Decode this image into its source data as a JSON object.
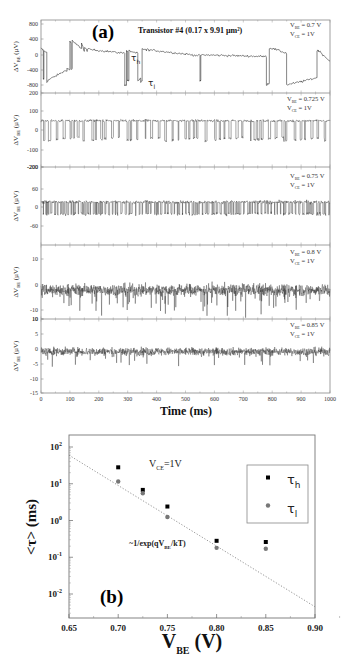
{
  "chart_data": [
    {
      "panel": "(a)",
      "type": "line",
      "title": "Transistor #4 (0.17 x 9.91 µm²)",
      "xlabel": "Time (ms)",
      "xlim": [
        0,
        1000
      ],
      "x_ticks": [
        "0",
        "100",
        "200",
        "300",
        "400",
        "500",
        "600",
        "700",
        "800",
        "900",
        "1000"
      ],
      "annotations": [
        "τh",
        "τl"
      ],
      "subplots": [
        {
          "ylabel": "ΔV_BE (µV)",
          "conditions": [
            "V_BE = 0.7 V",
            "V_CE = 1V"
          ],
          "y_ticks": [
            "800",
            "400",
            "0",
            "-400",
            "-800"
          ],
          "ylim": [
            -900,
            900
          ],
          "description": "Random telegraph signal, slow switching with drifting baseline between ~+300 and ~-600 µV",
          "levels": [
            {
              "state": "high",
              "approx_uV": 150
            },
            {
              "state": "low",
              "approx_uV": -600
            }
          ]
        },
        {
          "ylabel": "ΔV_BE (µV)",
          "conditions": [
            "V_BE = 0.725 V",
            "V_CE = 1V"
          ],
          "y_ticks": [
            "200",
            "100",
            "0",
            "-100",
            "-200"
          ],
          "ylim": [
            -200,
            200
          ],
          "description": "Two-level RTS switching between ~+50 and ~-60 µV",
          "levels": [
            {
              "state": "high",
              "approx_uV": 50
            },
            {
              "state": "low",
              "approx_uV": -60
            }
          ]
        },
        {
          "ylabel": "ΔV_BE (µV)",
          "conditions": [
            "V_BE = 0.75 V",
            "V_CE = 1V"
          ],
          "y_ticks": [
            "-200",
            "60",
            "0",
            "-60"
          ],
          "ylim": [
            -100,
            100
          ],
          "description": "Fast RTS switching between ~+10 and ~-20 µV",
          "levels": [
            {
              "state": "high",
              "approx_uV": 10
            },
            {
              "state": "low",
              "approx_uV": -20
            }
          ]
        },
        {
          "ylabel": "ΔV_BE (µV)",
          "conditions": [
            "V_BE = 0.8 V",
            "V_CE = 1V"
          ],
          "y_ticks": [
            "10",
            "0",
            "-10",
            "10"
          ],
          "ylim": [
            -12,
            15
          ],
          "description": "Noisy signal around ~-2 µV with downward spikes"
        },
        {
          "ylabel": "ΔV_BE (µV)",
          "conditions": [
            "V_BE = 0.85 V",
            "V_CE = 1V"
          ],
          "y_ticks": [
            "10",
            "5",
            "0",
            "-5",
            "-10",
            "-15"
          ],
          "ylim": [
            -15,
            10
          ],
          "description": "Noisy signal around ~-1 µV with occasional dips to ~-7 µV"
        }
      ]
    },
    {
      "panel": "(b)",
      "type": "scatter",
      "xlabel": "V_BE (V)",
      "ylabel": "<τ> (ms)",
      "xlim": [
        0.65,
        0.9
      ],
      "ylim": [
        0.002,
        200
      ],
      "yscale": "log",
      "x_ticks": [
        "0.65",
        "0.70",
        "0.75",
        "0.80",
        "0.85",
        "0.90"
      ],
      "y_ticks": [
        "10^2",
        "10^1",
        "10^0",
        "10^-1",
        "10^-2"
      ],
      "annotations": [
        "V_CE=1V",
        "~1/exp(qV_BE/kT)"
      ],
      "legend": {
        "position": "upper right",
        "entries": [
          "τh",
          "τl"
        ]
      },
      "series": [
        {
          "name": "τh",
          "marker": "square",
          "color": "#000000",
          "x": [
            0.7,
            0.725,
            0.75,
            0.8,
            0.85
          ],
          "y": [
            28,
            6.8,
            2.4,
            0.28,
            0.26
          ]
        },
        {
          "name": "τl",
          "marker": "circle",
          "color": "#777777",
          "x": [
            0.7,
            0.725,
            0.75,
            0.8,
            0.85
          ],
          "y": [
            11.5,
            5.5,
            1.25,
            0.18,
            0.17
          ]
        },
        {
          "name": "~1/exp(qV_BE/kT)",
          "style": "dotted",
          "color": "#888888",
          "x": [
            0.65,
            0.9
          ],
          "y": [
            60,
            0.0045
          ]
        }
      ]
    }
  ],
  "figure": {
    "panel_a": {
      "letter": "(a)",
      "title": "Transistor #4 (0.17 x 9.91 µm²)",
      "xlabel": "Time (ms)",
      "tau_h": "τ",
      "tau_h_sub": "h",
      "tau_l": "τ",
      "tau_l_sub": "l",
      "ylabel_main": "ΔV",
      "ylabel_sub": "BE",
      "ylabel_unit": " (µV)",
      "x_ticks": [
        "0",
        "100",
        "200",
        "300",
        "400",
        "500",
        "600",
        "700",
        "800",
        "900",
        "1000"
      ],
      "sub": [
        {
          "vbe": "V",
          "vbe_sub": "BE",
          "vbe_val": " = 0.7 V",
          "vce": "V",
          "vce_sub": "CE",
          "vce_val": " = 1V",
          "ticks": [
            "800",
            "400",
            "0",
            "-400",
            "-800"
          ]
        },
        {
          "vbe": "V",
          "vbe_sub": "BE",
          "vbe_val": " = 0.725 V",
          "vce": "V",
          "vce_sub": "CE",
          "vce_val": " = 1V",
          "ticks": [
            "200",
            "100",
            "0",
            "-100",
            "-200"
          ]
        },
        {
          "vbe": "V",
          "vbe_sub": "BE",
          "vbe_val": " = 0.75 V",
          "vce": "V",
          "vce_sub": "CE",
          "vce_val": " = 1V",
          "ticks": [
            "-200",
            "60",
            "0",
            "-60"
          ]
        },
        {
          "vbe": "V",
          "vbe_sub": "BE",
          "vbe_val": " = 0.8 V",
          "vce": "V",
          "vce_sub": "CE",
          "vce_val": " = 1V",
          "ticks": [
            "10",
            "0",
            "-10",
            "10"
          ]
        },
        {
          "vbe": "V",
          "vbe_sub": "BE",
          "vbe_val": " = 0.85 V",
          "vce": "V",
          "vce_sub": "CE",
          "vce_val": " = 1V",
          "ticks": [
            "10",
            "5",
            "0",
            "-5",
            "-10",
            "-15"
          ]
        }
      ]
    },
    "panel_b": {
      "letter": "(b)",
      "xlabel_main": "V",
      "xlabel_sub": "BE",
      "xlabel_unit": " (V)",
      "ylabel": "<τ> (ms)",
      "x_ticks": [
        "0.65",
        "0.70",
        "0.75",
        "0.80",
        "0.85",
        "0.90"
      ],
      "y_ticks": [
        {
          "base": "10",
          "exp": "2"
        },
        {
          "base": "10",
          "exp": "1"
        },
        {
          "base": "10",
          "exp": "0"
        },
        {
          "base": "10",
          "exp": "-1"
        },
        {
          "base": "10",
          "exp": "-2"
        }
      ],
      "vce_main": "V",
      "vce_sub": "CE",
      "vce_val": "=1V",
      "fit_pre": "~1/exp(qV",
      "fit_sub": "BE",
      "fit_post": "/kT)",
      "legend": [
        {
          "sym": "τ",
          "sub": "h"
        },
        {
          "sym": "τ",
          "sub": "l"
        }
      ]
    }
  }
}
